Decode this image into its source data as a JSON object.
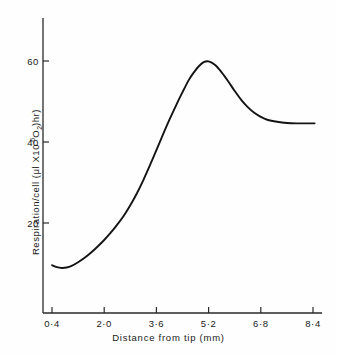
{
  "chart_data": {
    "type": "line",
    "title": "",
    "xlabel": "Distance from tip (mm)",
    "ylabel_plain": "Respiration/cell (μl X10⁻⁶O₂)hr)",
    "ylabel_parts": {
      "prefix": "Respiration/cell (μl X10",
      "exponent": "-6",
      "gas": "O",
      "gas_sub": "2",
      "suffix": ")hr)"
    },
    "xticklabels": [
      "0·4",
      "2·0",
      "3·6",
      "5·2",
      "6·8",
      "8·4"
    ],
    "xtickvalues": [
      0.4,
      2.0,
      3.6,
      5.2,
      6.8,
      8.4
    ],
    "yticklabels": [
      "20",
      "40",
      "60"
    ],
    "ytickvalues": [
      20,
      40,
      60
    ],
    "xlim": [
      0.4,
      8.4
    ],
    "ylim": [
      0,
      70
    ],
    "grid": false,
    "legend": null,
    "series": [
      {
        "name": "Respiration per cell",
        "x": [
          0.4,
          0.55,
          0.7,
          0.85,
          1.0,
          1.2,
          1.4,
          1.6,
          1.8,
          2.0,
          2.2,
          2.4,
          2.6,
          2.8,
          3.0,
          3.2,
          3.4,
          3.6,
          3.8,
          4.0,
          4.2,
          4.4,
          4.6,
          4.75,
          4.9,
          5.05,
          5.2,
          5.4,
          5.6,
          5.8,
          6.0,
          6.2,
          6.4,
          6.6,
          6.8,
          7.0,
          7.3,
          7.6,
          7.9,
          8.2,
          8.45
        ],
        "y": [
          9.6,
          9.1,
          8.9,
          9.0,
          9.4,
          10.3,
          11.4,
          12.7,
          14.2,
          15.8,
          17.6,
          19.6,
          21.8,
          24.4,
          27.3,
          30.6,
          34.2,
          38.0,
          41.8,
          45.5,
          49.0,
          52.3,
          55.4,
          57.2,
          58.7,
          59.7,
          59.9,
          59.0,
          57.2,
          55.0,
          52.6,
          50.4,
          48.6,
          47.2,
          46.2,
          45.5,
          45.0,
          44.7,
          44.6,
          44.6,
          44.6
        ]
      }
    ],
    "line_color": "#141414",
    "axis_color": "#2a2a2a",
    "background_color": "#fefefe",
    "peak": {
      "x": 5.2,
      "y": 60
    },
    "plateau_value": 44.6,
    "minimum": {
      "x": 0.7,
      "y": 8.9
    }
  }
}
